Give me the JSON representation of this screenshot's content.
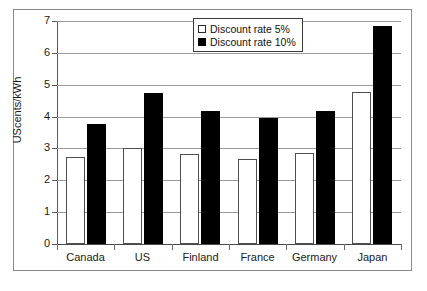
{
  "chart_data": {
    "type": "bar",
    "title": "",
    "subtitle": "",
    "xlabel": "",
    "ylabel": "UScents/kWh",
    "ylim": [
      0,
      7
    ],
    "yticks": [
      0,
      1,
      2,
      3,
      4,
      5,
      6,
      7
    ],
    "ytick_labels": [
      "0",
      "1",
      "2",
      "3",
      "4",
      "5",
      "6",
      "7"
    ],
    "grid": "horizontal",
    "legend_position": "upper-right-inside",
    "categories": [
      "Canada",
      "US",
      "Finland",
      "France",
      "Germany",
      "Japan"
    ],
    "series": [
      {
        "name": "Discount rate 5%",
        "color": "#ffffff",
        "edge_color": "#4f4f4f",
        "values": [
          2.73,
          3.0,
          2.82,
          2.68,
          2.87,
          4.78
        ]
      },
      {
        "name": "Discount rate 10%",
        "color": "#000000",
        "edge_color": "#000000",
        "values": [
          3.77,
          4.75,
          4.18,
          3.95,
          4.18,
          6.85
        ]
      }
    ]
  },
  "legend": {
    "items": [
      {
        "label": "Discount rate 5%",
        "swatch": "light"
      },
      {
        "label": "Discount rate 10%",
        "swatch": "dark"
      }
    ]
  },
  "colors": {
    "background": "#ffffff",
    "frame": "#8a8a8a",
    "gridline": "#9a9a9a",
    "axis": "#4a4a4a",
    "text": "#1a1a1a",
    "series_light": "#ffffff",
    "series_dark": "#000000"
  }
}
